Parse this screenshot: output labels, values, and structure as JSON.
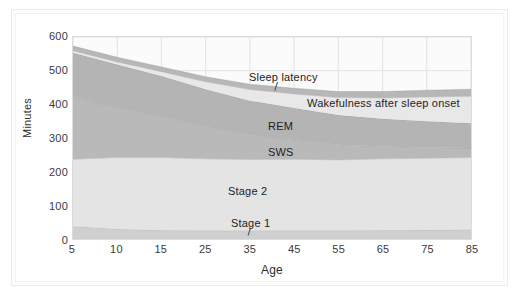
{
  "chart_data": {
    "type": "area",
    "title": "",
    "subtitle": "",
    "xlabel": "Age",
    "ylabel": "Minutes",
    "x": [
      5,
      10,
      15,
      25,
      35,
      45,
      55,
      65,
      75,
      85
    ],
    "xtick_labels": [
      "5",
      "10",
      "15",
      "25",
      "35",
      "45",
      "55",
      "65",
      "75",
      "85"
    ],
    "ytick_labels": [
      "0",
      "100",
      "200",
      "300",
      "400",
      "500",
      "600"
    ],
    "ylim": [
      0,
      600
    ],
    "ytick_step": 100,
    "grid": "both",
    "legend_position": "inline-annotations",
    "stacking": "bottom-to-top",
    "series": [
      {
        "name": "Stage 1",
        "color": "#cfcfcf",
        "values": [
          38,
          30,
          26,
          25,
          25,
          25,
          25,
          26,
          27,
          28
        ]
      },
      {
        "name": "Stage 2",
        "color": "#e4e4e4",
        "values": [
          199,
          212,
          216,
          213,
          211,
          212,
          210,
          212,
          213,
          214
        ]
      },
      {
        "name": "SWS",
        "color": "#b9b9b9",
        "values": [
          183,
          146,
          120,
          95,
          72,
          57,
          45,
          37,
          32,
          28
        ]
      },
      {
        "name": "REM",
        "color": "#b4b4b4",
        "values": [
          133,
          130,
          122,
          112,
          103,
          95,
          88,
          82,
          78,
          74
        ]
      },
      {
        "name": "Wakefulness after sleep onset",
        "color": "#e8e8e8",
        "values": [
          6,
          8,
          13,
          22,
          33,
          42,
          52,
          62,
          72,
          80
        ]
      },
      {
        "name": "Sleep latency",
        "color": "#b7b7b7",
        "values": [
          14,
          14,
          14,
          15,
          16,
          17,
          18,
          19,
          20,
          21
        ]
      }
    ],
    "annotations": [
      {
        "name": "sleep-latency",
        "label": "Sleep latency",
        "leader": true
      },
      {
        "name": "wakefulness",
        "label": "Wakefulness after sleep onset",
        "leader": false
      },
      {
        "name": "rem",
        "label": "REM",
        "leader": false
      },
      {
        "name": "sws",
        "label": "SWS",
        "leader": false
      },
      {
        "name": "stage-2",
        "label": "Stage 2",
        "leader": false
      },
      {
        "name": "stage-1",
        "label": "Stage 1",
        "leader": true
      }
    ],
    "colors": {
      "plot_background": "#fbfbfb",
      "grid": "#e3e3e3",
      "axis": "#9a9a9a",
      "text": "#2e2e2e",
      "frame": "#ececec"
    }
  }
}
